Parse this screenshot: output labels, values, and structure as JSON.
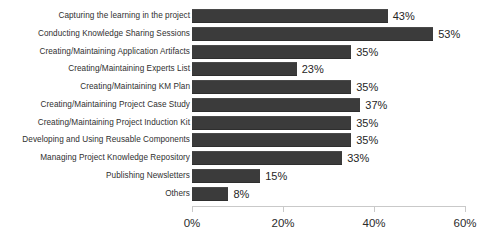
{
  "chart_data": {
    "type": "bar",
    "orientation": "horizontal",
    "title": "",
    "xlabel": "",
    "ylabel": "",
    "xlim": [
      0,
      60
    ],
    "grid": false,
    "legend": null,
    "value_suffix": "%",
    "bar_color": "#3b3b3b",
    "background_color": "#ffffff",
    "categories": [
      "Capturing the learning in the project",
      "Conducting Knowledge Sharing Sessions",
      "Creating/Maintaining Application Artifacts",
      "Creating/Maintaining Experts List",
      "Creating/Maintaining KM Plan",
      "Creating/Maintaining Project Case Study",
      "Creating/Maintaining Project Induction Kit",
      "Developing and Using Reusable Components",
      "Managing Project Knowledge Repository",
      "Publishing Newsletters",
      "Others"
    ],
    "values": [
      43,
      53,
      35,
      23,
      35,
      37,
      35,
      35,
      33,
      15,
      8
    ],
    "value_labels": [
      "43%",
      "53%",
      "35%",
      "23%",
      "35%",
      "37%",
      "35%",
      "35%",
      "33%",
      "15%",
      "8%"
    ],
    "xticks": [
      0,
      20,
      40,
      60
    ],
    "xtick_labels": [
      "0%",
      "20%",
      "40%",
      "60%"
    ]
  }
}
